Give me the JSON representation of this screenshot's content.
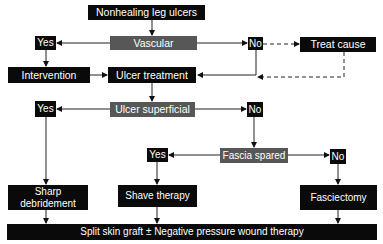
{
  "flowchart": {
    "start": "Nonhealing leg ulcers",
    "decision_vascular": {
      "label": "Vascular",
      "yes": "Yes",
      "no": "No"
    },
    "intervention": "Intervention",
    "treat_cause": "Treat cause",
    "ulcer_treatment": "Ulcer treatment",
    "decision_superficial": {
      "label": "Ulcer superficial",
      "yes": "Yes",
      "no": "No"
    },
    "decision_fascia": {
      "label": "Fascia spared",
      "yes": "Yes",
      "no": "No"
    },
    "sharp_debridement": "Sharp debridement",
    "sharp_debridement_lines": [
      "Sharp",
      "debridement"
    ],
    "shave_therapy": "Shave therapy",
    "fasciectomy": "Fasciectomy",
    "final": "Split skin graft ± Negative pressure wound therapy"
  },
  "colors": {
    "process_box": "#0a0a0a",
    "decision_box": "#575757",
    "text": "#ffffff",
    "line": "#222222"
  }
}
